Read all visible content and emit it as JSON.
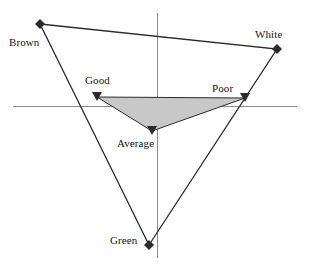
{
  "figure": {
    "title": "",
    "background_color": "#ffffff",
    "axis_color": "#8c8c8c",
    "outline_color": "#2b2b2b",
    "fill_color": "#c8c8c8",
    "marker_color": "#2b2b2b"
  },
  "axes": {
    "x_axis": {
      "name": "horizontal-axis",
      "x1": 13,
      "y1": 106,
      "x2": 297,
      "y2": 106
    },
    "y_axis": {
      "name": "vertical-axis",
      "x1": 157,
      "y1": 13,
      "x2": 157,
      "y2": 258
    }
  },
  "labels": {
    "brown": "Brown",
    "white": "White",
    "green": "Green",
    "good": "Good",
    "poor": "Poor",
    "average": "Average"
  },
  "chart_data": {
    "type": "scatter",
    "title": "",
    "xlabel": "",
    "ylabel": "",
    "grid": false,
    "legend": "none",
    "axis_ranges": {
      "x": [
        -1.0,
        1.0
      ],
      "y": [
        -1.0,
        1.0
      ]
    },
    "origin_px": {
      "x": 157,
      "y": 106
    },
    "series": [
      {
        "name": "Outer triangle (attributes)",
        "shape": "triangle",
        "filled": false,
        "outline_color": "#2b2b2b",
        "marker": "diamond",
        "points": [
          {
            "label": "Brown",
            "px": [
              40,
              24
            ],
            "xy": [
              -0.82,
              0.67
            ]
          },
          {
            "label": "White",
            "px": [
              277,
              49
            ],
            "xy": [
              0.84,
              0.47
            ]
          },
          {
            "label": "Green",
            "px": [
              149,
              245
            ],
            "xy": [
              -0.06,
              -1.13
            ]
          }
        ]
      },
      {
        "name": "Inner triangle (ratings)",
        "shape": "triangle",
        "filled": true,
        "fill_color": "#c8c8c8",
        "outline_color": "#2b2b2b",
        "marker": "triangle-down",
        "points": [
          {
            "label": "Good",
            "px": [
              97,
              97
            ],
            "xy": [
              -0.42,
              0.07
            ]
          },
          {
            "label": "Poor",
            "px": [
              245,
              98
            ],
            "xy": [
              0.62,
              0.06
            ]
          },
          {
            "label": "Average",
            "px": [
              152,
              131
            ],
            "xy": [
              -0.04,
              -0.18
            ]
          }
        ]
      }
    ]
  }
}
